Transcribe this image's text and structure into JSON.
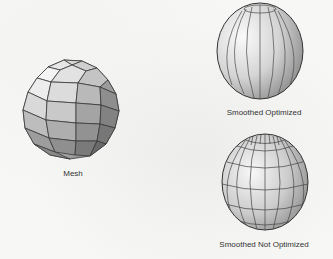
{
  "figures": [
    {
      "id": "mesh",
      "label": "Mesh",
      "icon": "faceted-sphere-icon"
    },
    {
      "id": "smoothed-optimized",
      "label": "Smoothed Optimized",
      "icon": "smooth-sphere-meridians-icon"
    },
    {
      "id": "smoothed-not-optimized",
      "label": "Smoothed Not Optimized",
      "icon": "smooth-sphere-grid-icon"
    }
  ],
  "colors": {
    "background": "#f7f7f5",
    "edge": "#3a3a3a",
    "surface_light": "#ececec",
    "surface_dark": "#8a8a8a"
  }
}
